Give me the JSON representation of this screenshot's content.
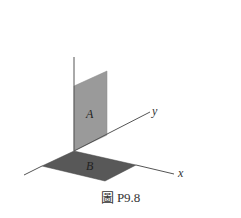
{
  "figure": {
    "caption": "圖 P9.8",
    "axes": {
      "x_label": "x",
      "y_label": "y",
      "z_label": ""
    },
    "panels": [
      {
        "label": "A",
        "plane": "vertical (z-y plane)",
        "color": "#999999"
      },
      {
        "label": "B",
        "plane": "horizontal (x-y plane)",
        "color": "#555555"
      }
    ],
    "colors": {
      "axis": "#555555",
      "panel_a_fill": "#9a9a9a",
      "panel_b_fill": "#585858",
      "background": "#ffffff"
    }
  }
}
